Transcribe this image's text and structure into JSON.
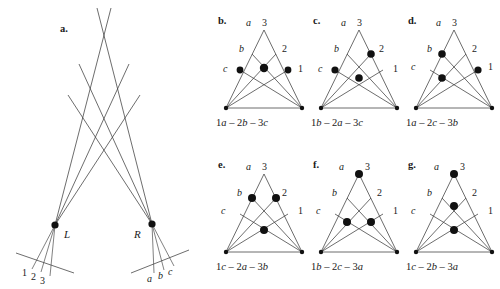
{
  "figure": {
    "type": "geometry-diagram",
    "panels": [
      {
        "id": "a",
        "letter": "a.",
        "kind": "ray-diagram",
        "vertex_labels": [
          "L",
          "R"
        ],
        "left_plane_ticks": [
          "1",
          "2",
          "3"
        ],
        "right_plane_ticks": [
          "a",
          "b",
          "c"
        ],
        "ray_count_per_vertex": 3
      },
      {
        "id": "b",
        "letter": "b.",
        "kind": "triangle",
        "apex_labels": [
          "a",
          "3"
        ],
        "upper_labels": [
          "b",
          "2"
        ],
        "lower_labels": [
          "c",
          "1"
        ],
        "caption": "1a − 2b − 3c",
        "caption_terms": [
          {
            "num": "1",
            "var": "a"
          },
          {
            "num": "2",
            "var": "b"
          },
          {
            "num": "3",
            "var": "c"
          }
        ],
        "dots": [
          {
            "x": 22,
            "y": 56
          },
          {
            "x": 46,
            "y": 54
          },
          {
            "x": 70,
            "y": 56
          }
        ]
      },
      {
        "id": "c",
        "letter": "c.",
        "kind": "triangle",
        "apex_labels": [
          "a",
          "3"
        ],
        "upper_labels": [
          "b",
          "2"
        ],
        "lower_labels": [
          "c",
          "1"
        ],
        "caption": "1b − 2a − 3c",
        "caption_terms": [
          {
            "num": "1",
            "var": "b"
          },
          {
            "num": "2",
            "var": "a"
          },
          {
            "num": "3",
            "var": "c"
          }
        ],
        "dots": [
          {
            "x": 22,
            "y": 56
          },
          {
            "x": 58,
            "y": 40
          },
          {
            "x": 46,
            "y": 64
          }
        ]
      },
      {
        "id": "d",
        "letter": "d.",
        "kind": "triangle",
        "apex_labels": [
          "a",
          "3"
        ],
        "upper_labels": [
          "b",
          "2"
        ],
        "lower_labels": [
          "c",
          "1"
        ],
        "caption": "1a − 2c − 3b",
        "caption_terms": [
          {
            "num": "1",
            "var": "a"
          },
          {
            "num": "2",
            "var": "c"
          },
          {
            "num": "3",
            "var": "b"
          }
        ],
        "dots": [
          {
            "x": 34,
            "y": 40
          },
          {
            "x": 34,
            "y": 64
          },
          {
            "x": 70,
            "y": 56
          }
        ]
      },
      {
        "id": "e",
        "letter": "e.",
        "kind": "triangle",
        "apex_labels": [
          "a",
          "3"
        ],
        "upper_labels": [
          "b",
          "2"
        ],
        "lower_labels": [
          "c",
          "1"
        ],
        "caption": "1c − 2a − 3b",
        "caption_terms": [
          {
            "num": "1",
            "var": "c"
          },
          {
            "num": "2",
            "var": "a"
          },
          {
            "num": "3",
            "var": "b"
          }
        ],
        "dots": [
          {
            "x": 34,
            "y": 40
          },
          {
            "x": 58,
            "y": 40
          },
          {
            "x": 46,
            "y": 72
          }
        ]
      },
      {
        "id": "f",
        "letter": "f.",
        "kind": "triangle",
        "apex_labels": [
          "a",
          "3"
        ],
        "upper_labels": [
          "b",
          "2"
        ],
        "lower_labels": [
          "c",
          "1"
        ],
        "caption": "1b − 2c − 3a",
        "caption_terms": [
          {
            "num": "1",
            "var": "b"
          },
          {
            "num": "2",
            "var": "c"
          },
          {
            "num": "3",
            "var": "a"
          }
        ],
        "dots": [
          {
            "x": 46,
            "y": 16
          },
          {
            "x": 34,
            "y": 64
          },
          {
            "x": 58,
            "y": 64
          }
        ]
      },
      {
        "id": "g",
        "letter": "g.",
        "kind": "triangle",
        "apex_labels": [
          "a",
          "3"
        ],
        "upper_labels": [
          "b",
          "2"
        ],
        "lower_labels": [
          "c",
          "1"
        ],
        "caption": "1c − 2b − 3a",
        "caption_terms": [
          {
            "num": "1",
            "var": "c"
          },
          {
            "num": "2",
            "var": "b"
          },
          {
            "num": "3",
            "var": "a"
          }
        ],
        "dots": [
          {
            "x": 46,
            "y": 16
          },
          {
            "x": 46,
            "y": 48
          },
          {
            "x": 46,
            "y": 72
          }
        ]
      }
    ]
  }
}
